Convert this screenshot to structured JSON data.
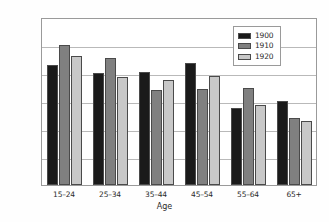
{
  "chart_data": {
    "type": "bar",
    "title": "",
    "xlabel": "Age",
    "ylabel": "Rate",
    "categories": [
      "15–24",
      "25–34",
      "35–44",
      "45–54",
      "55–64",
      "65+"
    ],
    "series": [
      {
        "name": "1900",
        "color": "#1a1a1a",
        "values": [
          85.5,
          80,
          80.5,
          87,
          55,
          60
        ]
      },
      {
        "name": "1910",
        "color": "#808080",
        "values": [
          100,
          91,
          68,
          68.5,
          69,
          48
        ]
      },
      {
        "name": "1920",
        "color": "#c8c8c8",
        "values": [
          92,
          77,
          75,
          78,
          57.5,
          46
        ]
      }
    ],
    "ylim": [
      0,
      120
    ],
    "ytick_labels": [
      "0%",
      "20%",
      "40%",
      "60%",
      "80%",
      "100%",
      "120%"
    ],
    "ytick_values": [
      0,
      20,
      40,
      60,
      80,
      100,
      120
    ],
    "grid": true,
    "legend_position": "top-right"
  }
}
